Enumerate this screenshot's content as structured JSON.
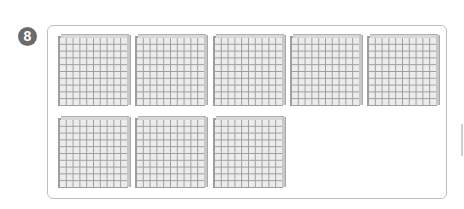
{
  "problem": {
    "number": "8"
  },
  "blocks": {
    "type": "hundred-block",
    "grid": "10x10",
    "count": 8,
    "rows": [
      {
        "count": 5
      },
      {
        "count": 3
      }
    ]
  },
  "colors": {
    "badge": "#6b6b6b",
    "frame_border": "#bdbdbd",
    "block_fill": "#ececec",
    "block_lines": "#9e9e9e"
  }
}
